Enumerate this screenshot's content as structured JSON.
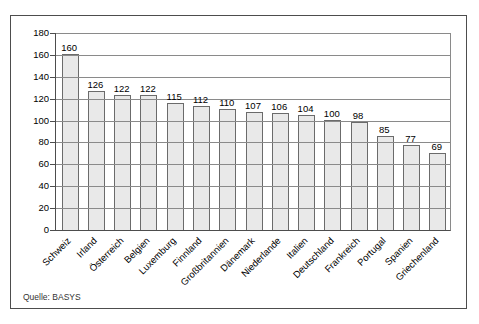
{
  "chart_data": {
    "type": "bar",
    "title": "",
    "xlabel": "",
    "ylabel": "",
    "categories": [
      "Schweiz",
      "Irland",
      "Österreich",
      "Belgien",
      "Luxemburg",
      "Finnland",
      "Großbritannien",
      "Dänemark",
      "Niederlande",
      "Italien",
      "Deutschland",
      "Frankreich",
      "Portugal",
      "Spanien",
      "Griechenland"
    ],
    "values": [
      160,
      126,
      122,
      122,
      115,
      112,
      110,
      107,
      106,
      104,
      100,
      98,
      85,
      77,
      69
    ],
    "ylim": [
      0,
      180
    ],
    "yticks": [
      0,
      20,
      40,
      60,
      80,
      100,
      120,
      140,
      160,
      180
    ],
    "grid": "horizontal",
    "gridlines_over_bars": true,
    "legend": "none",
    "value_labels_shown": true,
    "colors": {
      "bar_fill": "#e9e9e9",
      "bar_border": "#6b6b6b",
      "gridline": "#8a8a8a",
      "axis": "#4d4d4d",
      "text": "#000000",
      "background": "#ffffff"
    }
  },
  "source": {
    "note": "Quelle: BASYS"
  }
}
